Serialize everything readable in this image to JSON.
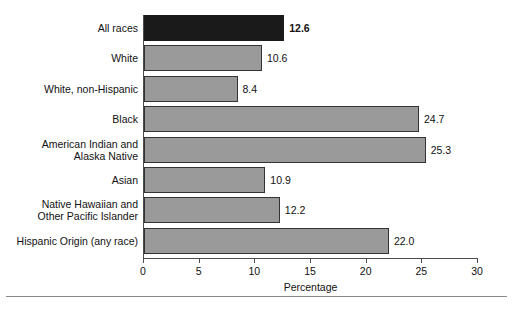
{
  "chart_data": {
    "type": "bar",
    "orientation": "horizontal",
    "title": "",
    "xlabel": "Percentage",
    "ylabel": "",
    "xlim": [
      0,
      30
    ],
    "xticks": [
      0,
      5,
      10,
      15,
      20,
      25,
      30
    ],
    "xtick_labels": [
      "0",
      "5",
      "10",
      "15",
      "20",
      "25",
      "30"
    ],
    "grid": false,
    "legend": null,
    "categories": [
      "All races",
      "White",
      "White, non-Hispanic",
      "Black",
      "American Indian and Alaska Native",
      "Asian",
      "Native Hawaiian and Other Pacific Islander",
      "Hispanic Origin (any race)"
    ],
    "values": [
      12.6,
      10.6,
      8.4,
      24.7,
      25.3,
      10.9,
      12.2,
      22.0
    ],
    "value_labels": [
      "12.6",
      "10.6",
      "8.4",
      "24.7",
      "25.3",
      "10.9",
      "12.2",
      "22.0"
    ],
    "colors": {
      "bar_fill": "#9a9a9a",
      "bar_border": "#333333",
      "highlight_fill": "#1a1a1a",
      "axis": "#4d4d4d",
      "text": "#111111"
    },
    "bars": [
      {
        "label_lines": [
          "All races"
        ],
        "value": 12.6,
        "value_label": "12.6",
        "highlight": true
      },
      {
        "label_lines": [
          "White"
        ],
        "value": 10.6,
        "value_label": "10.6",
        "highlight": false
      },
      {
        "label_lines": [
          "White, non-Hispanic"
        ],
        "value": 8.4,
        "value_label": "8.4",
        "highlight": false
      },
      {
        "label_lines": [
          "Black"
        ],
        "value": 24.7,
        "value_label": "24.7",
        "highlight": false
      },
      {
        "label_lines": [
          "American Indian and",
          "Alaska Native"
        ],
        "value": 25.3,
        "value_label": "25.3",
        "highlight": false
      },
      {
        "label_lines": [
          "Asian"
        ],
        "value": 10.9,
        "value_label": "10.9",
        "highlight": false
      },
      {
        "label_lines": [
          "Native Hawaiian and",
          "Other Pacific Islander"
        ],
        "value": 12.2,
        "value_label": "12.2",
        "highlight": false
      },
      {
        "label_lines": [
          "Hispanic Origin (any race)"
        ],
        "value": 22.0,
        "value_label": "22.0",
        "highlight": false
      }
    ]
  }
}
